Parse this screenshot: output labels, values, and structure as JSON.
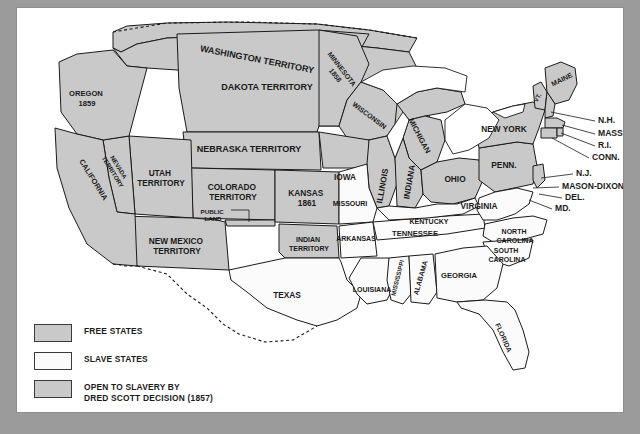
{
  "map": {
    "title": "United States Free and Slave States map",
    "colors": {
      "free": "#c9c9c9",
      "slave": "#fbfbfb",
      "dred_scott": "#c9c9c9",
      "outline": "#1a1a1a",
      "page": "#ffffff",
      "backdrop": "#9b9b9b"
    },
    "regions": [
      {
        "name": "washington-territory",
        "label": "WASHINGTON TERRITORY",
        "category": "dred_scott"
      },
      {
        "name": "oregon",
        "label": "OREGON",
        "year": "1859",
        "category": "free"
      },
      {
        "name": "california",
        "label": "CALIFORNIA",
        "category": "free"
      },
      {
        "name": "nevada-territory",
        "label": "NEVADA TERRITORY",
        "category": "dred_scott"
      },
      {
        "name": "utah-territory",
        "label": "UTAH TERRITORY",
        "category": "dred_scott"
      },
      {
        "name": "dakota-territory",
        "label": "DAKOTA TERRITORY",
        "category": "dred_scott"
      },
      {
        "name": "nebraska-territory",
        "label": "NEBRASKA TERRITORY",
        "category": "dred_scott"
      },
      {
        "name": "colorado-territory",
        "label": "COLORADO TERRITORY",
        "category": "dred_scott"
      },
      {
        "name": "kansas",
        "label": "KANSAS",
        "year": "1861",
        "category": "free"
      },
      {
        "name": "new-mexico-territory",
        "label": "NEW MEXICO TERRITORY",
        "category": "dred_scott"
      },
      {
        "name": "public-land",
        "label": "PUBLIC LAND",
        "category": "dred_scott"
      },
      {
        "name": "indian-territory",
        "label": "INDIAN TERRITORY",
        "category": "dred_scott"
      },
      {
        "name": "minnesota",
        "label": "MINNESOTA",
        "year": "1858",
        "category": "free"
      },
      {
        "name": "wisconsin",
        "label": "WISCONSIN",
        "category": "free"
      },
      {
        "name": "michigan",
        "label": "MICHIGAN",
        "category": "free"
      },
      {
        "name": "iowa",
        "label": "IOWA",
        "category": "free"
      },
      {
        "name": "illinois",
        "label": "ILLINOIS",
        "category": "free"
      },
      {
        "name": "indiana",
        "label": "INDIANA",
        "category": "free"
      },
      {
        "name": "ohio",
        "label": "OHIO",
        "category": "free"
      },
      {
        "name": "pennsylvania",
        "label": "PENN.",
        "category": "free"
      },
      {
        "name": "new-york",
        "label": "NEW YORK",
        "category": "free"
      },
      {
        "name": "maine",
        "label": "MAINE",
        "category": "free"
      },
      {
        "name": "vermont",
        "label": "VT.",
        "category": "free"
      },
      {
        "name": "missouri",
        "label": "MISSOURI",
        "category": "slave"
      },
      {
        "name": "arkansas",
        "label": "ARKANSAS",
        "category": "slave"
      },
      {
        "name": "texas",
        "label": "TEXAS",
        "category": "slave"
      },
      {
        "name": "louisiana",
        "label": "LOUISIANA",
        "category": "slave"
      },
      {
        "name": "mississippi",
        "label": "MISSISSIPPI",
        "category": "slave"
      },
      {
        "name": "alabama",
        "label": "ALABAMA",
        "category": "slave"
      },
      {
        "name": "tennessee",
        "label": "TENNESSEE",
        "category": "slave"
      },
      {
        "name": "kentucky",
        "label": "KENTUCKY",
        "category": "slave"
      },
      {
        "name": "virginia",
        "label": "VIRGINIA",
        "category": "slave"
      },
      {
        "name": "north-carolina",
        "label": "NORTH CAROLINA",
        "category": "slave"
      },
      {
        "name": "south-carolina",
        "label": "SOUTH CAROLINA",
        "category": "slave"
      },
      {
        "name": "georgia",
        "label": "GEORGIA",
        "category": "slave"
      },
      {
        "name": "florida",
        "label": "FLORIDA",
        "category": "slave"
      }
    ],
    "leader_labels": [
      {
        "name": "new-hampshire",
        "label": "N.H."
      },
      {
        "name": "massachusetts",
        "label": "MASS."
      },
      {
        "name": "rhode-island",
        "label": "R.I."
      },
      {
        "name": "connecticut",
        "label": "CONN."
      },
      {
        "name": "new-jersey",
        "label": "N.J."
      },
      {
        "name": "mason-dixon-line",
        "label": "MASON-DIXON LINE"
      },
      {
        "name": "delaware",
        "label": "DEL."
      },
      {
        "name": "maryland",
        "label": "MD."
      }
    ]
  },
  "legend": {
    "items": [
      {
        "name": "legend-free-states",
        "label": "FREE STATES",
        "swatch": "free"
      },
      {
        "name": "legend-slave-states",
        "label": "SLAVE STATES",
        "swatch": "slave"
      },
      {
        "name": "legend-dred-scott",
        "label_line1": "OPEN TO SLAVERY BY",
        "label_line2": "DRED SCOTT DECISION (1857)",
        "swatch": "dred_scott"
      }
    ]
  }
}
